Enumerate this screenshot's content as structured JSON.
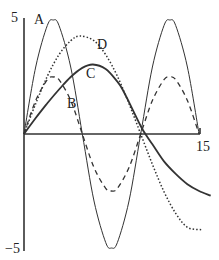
{
  "chart_data": {
    "type": "line",
    "title": "",
    "xlabel": "",
    "ylabel": "",
    "xlim": [
      0,
      15
    ],
    "ylim": [
      -5,
      5
    ],
    "grid": false,
    "legend": "inline labels",
    "y_ticks": [
      "5",
      "−5"
    ],
    "x_ticks": [
      "15"
    ],
    "series": [
      {
        "name": "A",
        "style": "solid-thin",
        "x": [
          0,
          1,
          2,
          2.5,
          3,
          4,
          5,
          6,
          7,
          7.5,
          8,
          9,
          10,
          11,
          12,
          12.5,
          13,
          14,
          15
        ],
        "values": [
          0,
          2.94,
          4.76,
          5,
          4.76,
          2.94,
          0,
          -2.94,
          -4.76,
          -5,
          -4.76,
          -2.94,
          0,
          2.94,
          4.76,
          5,
          4.76,
          2.94,
          0
        ]
      },
      {
        "name": "B",
        "style": "dashed",
        "x": [
          0,
          1,
          2,
          2.5,
          3,
          4,
          5,
          6,
          7,
          7.5,
          8,
          9,
          10,
          11,
          12,
          12.5,
          13,
          14,
          15
        ],
        "values": [
          0,
          1.47,
          2.38,
          2.5,
          2.38,
          1.47,
          0,
          -1.47,
          -2.38,
          -2.5,
          -2.38,
          -1.47,
          0,
          1.47,
          2.38,
          2.5,
          2.38,
          1.47,
          0
        ]
      },
      {
        "name": "C",
        "style": "solid-thick",
        "x": [
          0,
          1,
          2,
          3,
          4,
          5,
          5.9,
          7,
          8,
          8.5,
          9,
          10,
          10.4,
          11,
          12,
          13,
          14,
          15,
          16
        ],
        "values": [
          0,
          0.7,
          1.35,
          1.95,
          2.5,
          2.9,
          3.05,
          2.85,
          2.3,
          1.9,
          1.4,
          0.35,
          0,
          -0.45,
          -1.2,
          -1.75,
          -2.2,
          -2.5,
          -2.7
        ]
      },
      {
        "name": "D",
        "style": "dotted",
        "x": [
          0,
          1,
          2,
          3,
          4,
          4.8,
          6,
          7,
          8,
          9,
          10,
          11,
          12,
          13,
          14,
          15.2
        ],
        "values": [
          0,
          1.33,
          2.53,
          3.48,
          4.09,
          4.3,
          4.09,
          3.48,
          2.53,
          1.33,
          0,
          -1.33,
          -2.53,
          -3.48,
          -4.09,
          -4.2
        ]
      }
    ],
    "annotations": [
      {
        "text": "A",
        "x": 1.3,
        "y": 5.0
      },
      {
        "text": "B",
        "x": 4.1,
        "y": 1.3
      },
      {
        "text": "C",
        "x": 5.8,
        "y": 2.6
      },
      {
        "text": "D",
        "x": 6.6,
        "y": 3.95
      }
    ]
  },
  "labels": {
    "y_max": "5",
    "y_min": "−5",
    "x_max": "15",
    "A": "A",
    "B": "B",
    "C": "C",
    "D": "D"
  }
}
